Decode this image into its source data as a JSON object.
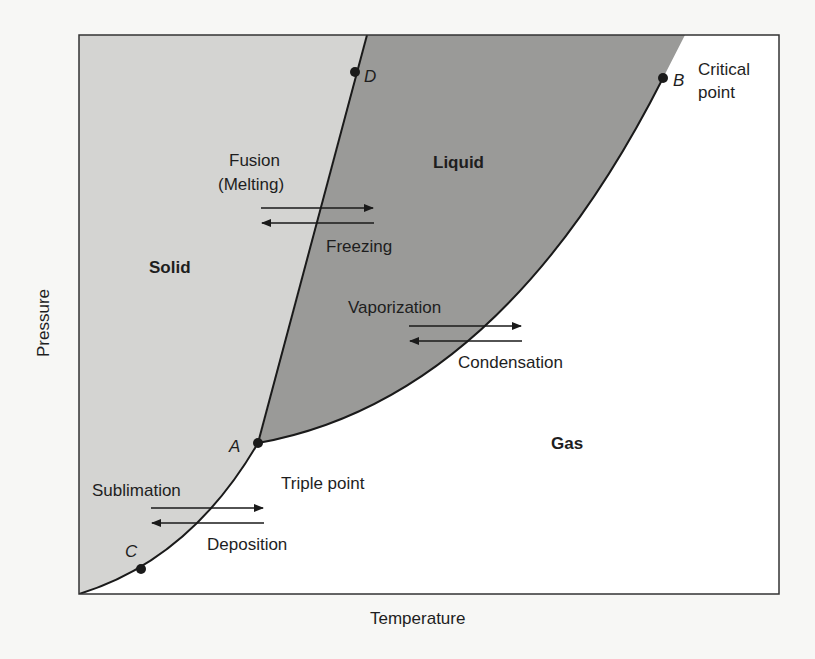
{
  "diagram": {
    "type": "phase-diagram",
    "axes": {
      "x_label": "Temperature",
      "y_label": "Pressure"
    },
    "regions": [
      {
        "name": "Solid",
        "color": "#d4d4d2"
      },
      {
        "name": "Liquid",
        "color": "#9a9a98"
      },
      {
        "name": "Gas",
        "color": "#ffffff"
      }
    ],
    "points": [
      {
        "id": "A",
        "label": "A",
        "description": "Triple point"
      },
      {
        "id": "B",
        "label": "B",
        "description_line1": "Critical",
        "description_line2": "point"
      },
      {
        "id": "C",
        "label": "C"
      },
      {
        "id": "D",
        "label": "D"
      }
    ],
    "transitions": {
      "fusion_line1": "Fusion",
      "fusion_line2": "(Melting)",
      "freezing": "Freezing",
      "vaporization": "Vaporization",
      "condensation": "Condensation",
      "sublimation": "Sublimation",
      "deposition": "Deposition"
    },
    "line_color": "#1a1a1a",
    "frame_color": "#333333"
  }
}
